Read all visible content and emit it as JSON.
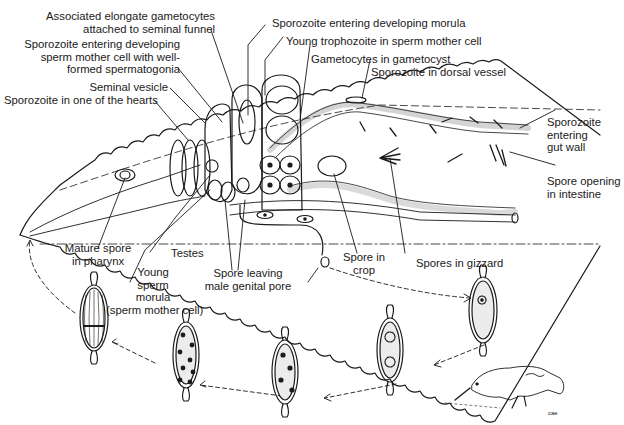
{
  "diagram": {
    "labels": {
      "assoc_gametocytes": [
        "Associated elongate gametocytes",
        "attached to seminal funnel"
      ],
      "sporozoite_sperm_mother": [
        "Sporozoite entering developing",
        "sperm mother cell with well-",
        "formed spermatogonia"
      ],
      "seminal_vesicle": "Seminal vesicle",
      "sporozoite_heart": "Sporozoite in one of the hearts",
      "sporozoite_morula": "Sporozoite entering developing morula",
      "young_trophozoite": "Young trophozoite in sperm mother cell",
      "gametocytes_gametocyst": "Gametocytes in gametocyst",
      "sporozoite_dorsal_vessel": "Sporozoite in dorsal vessel",
      "sporozoite_gut_wall": [
        "Sporozoite",
        "entering",
        "gut wall"
      ],
      "spore_opening": [
        "Spore opening",
        "in intestine"
      ],
      "mature_spore_pharynx": [
        "Mature spore",
        "in pharynx"
      ],
      "testes": "Testes",
      "young_sperm_morula": [
        "Young",
        "sperm",
        "morula",
        "(sperm mother cell)"
      ],
      "spore_leaving": [
        "Spore leaving",
        "male genital pore"
      ],
      "spore_crop": [
        "Spore in",
        "crop"
      ],
      "spores_gizzard": "Spores in gizzard"
    },
    "spore_stages": [
      {
        "id": "spore-1",
        "desc": "single nucleus"
      },
      {
        "id": "spore-2",
        "desc": "two nuclei"
      },
      {
        "id": "spore-3",
        "desc": "four nuclei"
      },
      {
        "id": "spore-4",
        "desc": "eight nuclei"
      },
      {
        "id": "spore-5",
        "desc": "eight sporozoites"
      }
    ],
    "signature": "cae"
  }
}
